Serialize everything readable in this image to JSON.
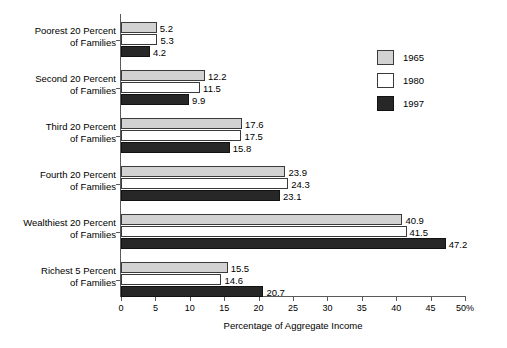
{
  "chart_data": {
    "type": "bar",
    "orientation": "horizontal",
    "title": "",
    "clipped_title_fragment": "",
    "xlabel": "Percentage of Aggregate Income",
    "ylabel": "",
    "xlim": [
      0,
      50
    ],
    "xticks": [
      0,
      5,
      10,
      15,
      20,
      25,
      30,
      35,
      40,
      45,
      50
    ],
    "xtick_labels": [
      "0",
      "5",
      "10",
      "15",
      "20",
      "25",
      "30",
      "35",
      "40",
      "45",
      "50%"
    ],
    "grid": false,
    "legend_position": "right",
    "categories": [
      "Poorest 20 Percent\nof Families",
      "Second 20 Percent\nof Families",
      "Third 20 Percent\nof Families",
      "Fourth 20 Percent\nof Families",
      "Wealthiest 20 Percent\nof Families",
      "Richest 5 Percent\nof Families"
    ],
    "category_lines": [
      [
        "Poorest 20 Percent",
        "of Families"
      ],
      [
        "Second 20 Percent",
        "of Families"
      ],
      [
        "Third 20 Percent",
        "of Families"
      ],
      [
        "Fourth 20 Percent",
        "of Families"
      ],
      [
        "Wealthiest 20 Percent",
        "of Families"
      ],
      [
        "Richest 5 Percent",
        "of Families"
      ]
    ],
    "series": [
      {
        "name": "1965",
        "color": "#d2d2d2",
        "values": [
          5.2,
          12.2,
          17.6,
          23.9,
          40.9,
          15.5
        ]
      },
      {
        "name": "1980",
        "color": "#ffffff",
        "values": [
          5.3,
          11.5,
          17.5,
          24.3,
          41.5,
          14.6
        ]
      },
      {
        "name": "1997",
        "color": "#272727",
        "values": [
          4.2,
          9.9,
          15.8,
          23.1,
          47.2,
          20.7
        ]
      }
    ],
    "value_labels": [
      [
        "5.2",
        "5.3",
        "4.2"
      ],
      [
        "12.2",
        "11.5",
        "9.9"
      ],
      [
        "17.6",
        "17.5",
        "15.8"
      ],
      [
        "23.9",
        "24.3",
        "23.1"
      ],
      [
        "40.9",
        "41.5",
        "47.2"
      ],
      [
        "15.5",
        "14.6",
        "20.7"
      ]
    ]
  },
  "legend": {
    "entries": [
      {
        "label": "1965",
        "swatch": "light-gray-swatch"
      },
      {
        "label": "1980",
        "swatch": "white-swatch"
      },
      {
        "label": "1997",
        "swatch": "dark-swatch"
      }
    ]
  },
  "axis": {
    "x_title": "Percentage of Aggregate Income",
    "tick_labels": [
      "0",
      "5",
      "10",
      "15",
      "20",
      "25",
      "30",
      "35",
      "40",
      "45",
      "50%"
    ]
  },
  "colors": {
    "series_1965": "#d2d2d2",
    "series_1980": "#ffffff",
    "series_1997": "#272727",
    "axis": "#5a5a5a",
    "text": "#000000",
    "background": "#ffffff"
  }
}
